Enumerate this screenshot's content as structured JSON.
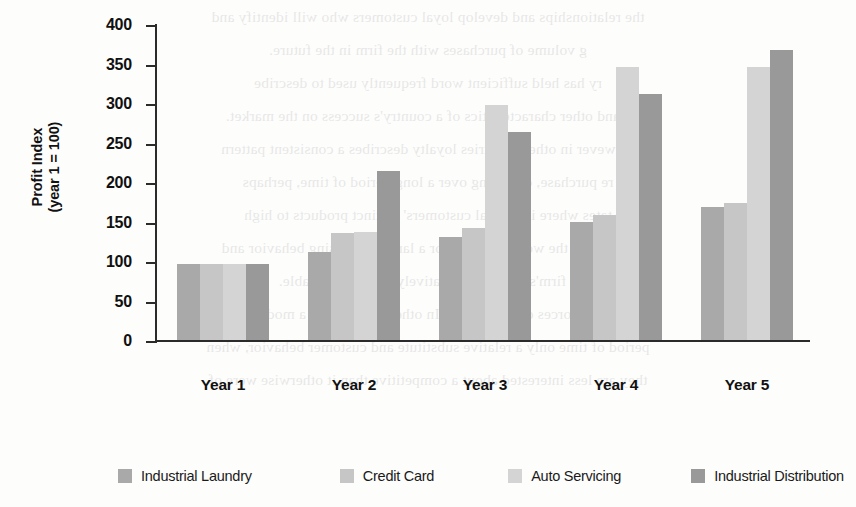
{
  "chart_data": {
    "type": "bar",
    "title": "",
    "xlabel": "",
    "ylabel": "Profit Index\n(year 1 = 100)",
    "ylabel_lines": [
      "Profit Index",
      "(year 1 = 100)"
    ],
    "categories": [
      "Year 1",
      "Year 2",
      "Year 3",
      "Year 4",
      "Year 5"
    ],
    "ylim": [
      0,
      400
    ],
    "yticks": [
      0,
      50,
      100,
      150,
      200,
      250,
      300,
      350,
      400
    ],
    "ytick_labels": [
      "0",
      "50",
      "100",
      "150",
      "200",
      "250",
      "300",
      "350",
      "400"
    ],
    "grid": false,
    "legend_position": "bottom",
    "series": [
      {
        "name": "Industrial Laundry",
        "color": "#a9a9a9",
        "values": [
          96,
          112,
          130,
          150,
          168
        ]
      },
      {
        "name": "Credit Card",
        "color": "#c6c6c6",
        "values": [
          96,
          136,
          142,
          158,
          173
        ]
      },
      {
        "name": "Auto Servicing",
        "color": "#d4d4d4",
        "values": [
          96,
          137,
          298,
          345,
          346
        ]
      },
      {
        "name": "Industrial Distribution",
        "color": "#999999",
        "values": [
          96,
          214,
          263,
          312,
          367
        ]
      }
    ]
  },
  "background_text": {
    "lines": [
      "the relationships and develop loyal customers who will identify and",
      "g volume of purchases with the firm in the future.",
      "ry has held sufficient word frequently used to describe",
      "s and other characteristics of a country's success on the market.",
      "However in other countries loyalty describes a consistent pattern",
      "re purchase, occurring over a long period of time, perhaps",
      "tates where industrial customers' distinct products to high",
      "as seen in the world's leading or a large purchasing behavior and",
      "a firm's resources, relatively more identifiable.",
      "nomic forces of innovation. In other words, over a moderate",
      "period of time only a relative substitute and customer behavior, when",
      "they are less interested about a competitive than it otherwise were of"
    ]
  }
}
